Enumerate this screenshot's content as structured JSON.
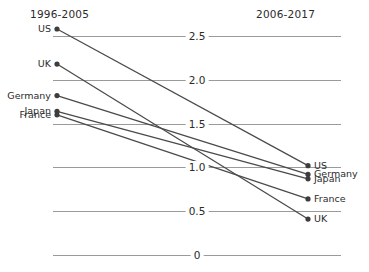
{
  "header": {
    "left_title": "1996-2005",
    "right_title": "2006-2017"
  },
  "axis": {
    "ticks": [
      "2.5",
      "2.0",
      "1.5",
      "1.0",
      "0.5",
      "0"
    ],
    "tick_values": [
      2.5,
      2.0,
      1.5,
      1.0,
      0.5,
      0
    ]
  },
  "labels": {
    "left": [
      "US",
      "UK",
      "Germany",
      "Japan",
      "France"
    ],
    "right": [
      "US",
      "Germany",
      "Japan",
      "France",
      "UK"
    ]
  },
  "colors": {
    "line": "#4a4a4a",
    "grid": "#9a9a9a",
    "dot": "#3d3d3d",
    "text": "#2b2b2b",
    "background": "#ffffff"
  },
  "chart_data": {
    "type": "line",
    "subtype": "slope",
    "title": "",
    "xlabel": "",
    "ylabel": "",
    "categories": [
      "1996-2005",
      "2006-2017"
    ],
    "ylim": [
      0,
      2.75
    ],
    "grid": true,
    "legend": "inline-endpoint-labels",
    "series": [
      {
        "name": "US",
        "values": [
          2.58,
          1.02
        ]
      },
      {
        "name": "UK",
        "values": [
          2.18,
          0.41
        ]
      },
      {
        "name": "Germany",
        "values": [
          1.82,
          0.92
        ]
      },
      {
        "name": "Japan",
        "values": [
          1.64,
          0.87
        ]
      },
      {
        "name": "France",
        "values": [
          1.6,
          0.64
        ]
      }
    ]
  }
}
